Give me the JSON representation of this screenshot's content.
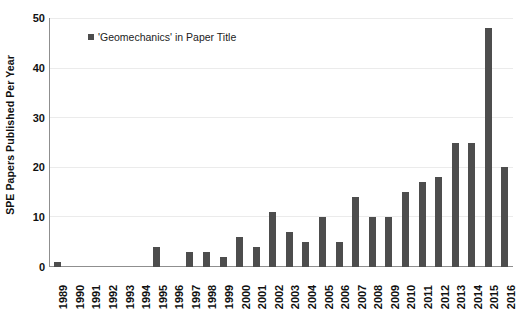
{
  "chart_data": {
    "type": "bar",
    "title": "",
    "xlabel": "",
    "ylabel": "SPE Papers Published Per Year",
    "ylim": [
      0,
      50
    ],
    "yticks": [
      0,
      10,
      20,
      30,
      40,
      50
    ],
    "grid": true,
    "legend_position": "top-left-inside",
    "series_name": "'Geomechanics' in Paper Title",
    "series_color": "#4d4d4d",
    "categories": [
      "1989",
      "1990",
      "1991",
      "1992",
      "1993",
      "1994",
      "1995",
      "1996",
      "1997",
      "1998",
      "1999",
      "2000",
      "2001",
      "2002",
      "2003",
      "2004",
      "2005",
      "2006",
      "2007",
      "2008",
      "2009",
      "2010",
      "2011",
      "2012",
      "2013",
      "2014",
      "2015",
      "2016"
    ],
    "values": [
      1,
      0,
      0,
      0,
      0,
      0,
      4,
      0,
      3,
      3,
      2,
      6,
      4,
      11,
      7,
      5,
      10,
      5,
      14,
      10,
      10,
      15,
      17,
      18,
      25,
      25,
      48,
      20
    ]
  },
  "legend": {
    "label": "'Geomechanics' in Paper Title"
  },
  "colors": {
    "bar": "#4d4d4d",
    "axis": "#8f8f8f",
    "gridline": "#ebebeb",
    "text": "#111111"
  }
}
